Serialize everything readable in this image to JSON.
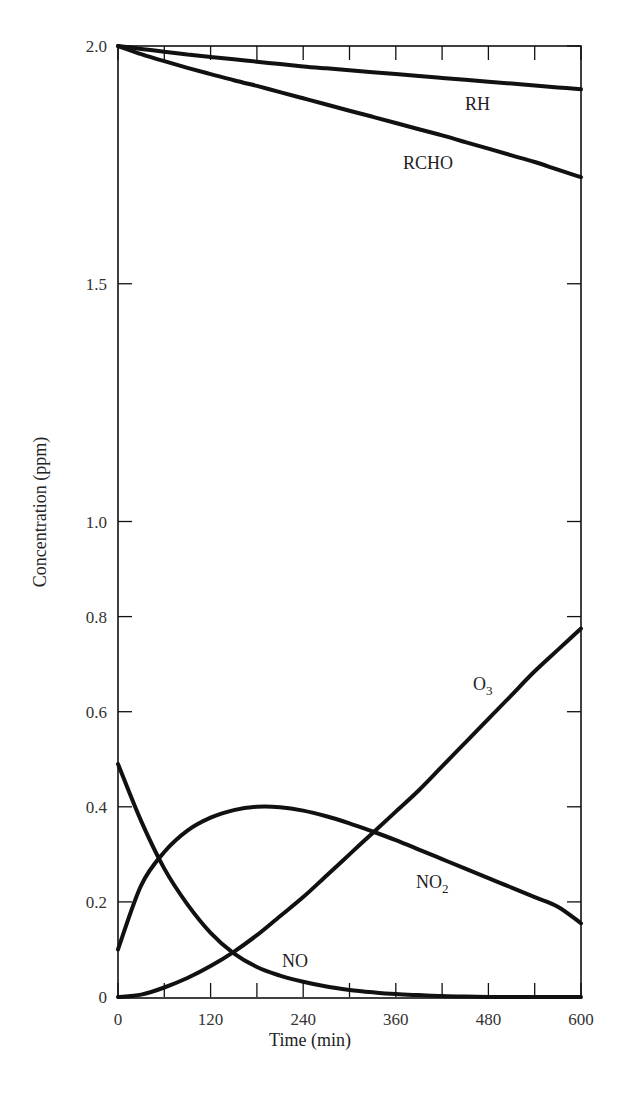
{
  "chart_data": {
    "type": "line",
    "title": "",
    "xlabel": "Time (min)",
    "ylabel": "Concentration (ppm)",
    "xlim": [
      0,
      600
    ],
    "ylim": [
      0,
      2.0
    ],
    "x_ticks": [
      0,
      120,
      240,
      360,
      480,
      600
    ],
    "x_minor_ticks": [
      60,
      180,
      300,
      420,
      540
    ],
    "y_ticks": [
      0,
      0.2,
      0.4,
      0.6,
      0.8,
      1.0,
      1.5,
      2.0
    ],
    "y_tick_labels": [
      "0",
      "0.2",
      "0.4",
      "0.6",
      "0.8",
      "1.0",
      "1.5",
      "2.0"
    ],
    "grid": false,
    "legend": "inline labels",
    "x": [
      0,
      30,
      60,
      90,
      120,
      150,
      180,
      210,
      240,
      270,
      300,
      330,
      360,
      390,
      420,
      450,
      480,
      510,
      540,
      570,
      600
    ],
    "series": [
      {
        "name": "RH",
        "label": "RH",
        "values": [
          2.0,
          1.994,
          1.988,
          1.982,
          1.977,
          1.972,
          1.967,
          1.962,
          1.957,
          1.953,
          1.949,
          1.945,
          1.941,
          1.937,
          1.933,
          1.929,
          1.925,
          1.921,
          1.917,
          1.913,
          1.909
        ]
      },
      {
        "name": "RCHO",
        "label": "RCHO",
        "values": [
          2.0,
          1.983,
          1.968,
          1.954,
          1.941,
          1.928,
          1.916,
          1.903,
          1.89,
          1.877,
          1.864,
          1.851,
          1.838,
          1.825,
          1.812,
          1.798,
          1.784,
          1.77,
          1.756,
          1.74,
          1.724
        ]
      },
      {
        "name": "O3",
        "label": "O",
        "label_sub": "3",
        "values": [
          0.0,
          0.005,
          0.02,
          0.04,
          0.065,
          0.095,
          0.13,
          0.17,
          0.21,
          0.255,
          0.3,
          0.345,
          0.39,
          0.435,
          0.485,
          0.535,
          0.585,
          0.635,
          0.685,
          0.73,
          0.775
        ]
      },
      {
        "name": "NO2",
        "label": "NO",
        "label_sub": "2",
        "values": [
          0.1,
          0.235,
          0.305,
          0.35,
          0.377,
          0.393,
          0.4,
          0.399,
          0.392,
          0.38,
          0.365,
          0.348,
          0.33,
          0.31,
          0.29,
          0.27,
          0.25,
          0.23,
          0.21,
          0.19,
          0.155
        ]
      },
      {
        "name": "NO",
        "label": "NO",
        "values": [
          0.49,
          0.37,
          0.27,
          0.195,
          0.135,
          0.092,
          0.063,
          0.045,
          0.032,
          0.022,
          0.015,
          0.01,
          0.006,
          0.004,
          0.002,
          0.001,
          0.0,
          0.0,
          0.0,
          0.0,
          0.0
        ]
      }
    ],
    "annotations": [
      {
        "text": "RH",
        "x": 480,
        "y": 1.87
      },
      {
        "text": "RCHO",
        "x": 420,
        "y": 1.76
      },
      {
        "text": "O3",
        "x": 470,
        "y": 0.66
      },
      {
        "text": "NO2",
        "x": 390,
        "y": 0.24
      },
      {
        "text": "NO",
        "x": 240,
        "y": 0.075
      }
    ]
  },
  "axes": {
    "x_title": "Time (min)",
    "y_title": "Concentration (ppm)"
  }
}
